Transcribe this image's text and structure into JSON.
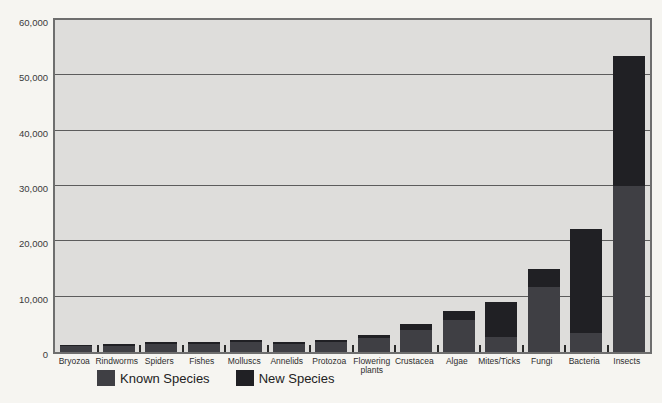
{
  "chart_data": {
    "type": "bar",
    "stacked": true,
    "title": "",
    "xlabel": "",
    "ylabel": "",
    "categories": [
      "Bryozoa",
      "Rindworms",
      "Spiders",
      "Fishes",
      "Molluscs",
      "Annelids",
      "Protozoa",
      "Flowering\nplants",
      "Crustacea",
      "Algae",
      "Mites/Ticks",
      "Fungi",
      "Bacteria",
      "Insects"
    ],
    "series": [
      {
        "name": "Known Species",
        "color": "#3f3f44",
        "values": [
          1000,
          1100,
          1500,
          1400,
          1800,
          1500,
          1800,
          2500,
          4000,
          5800,
          2800,
          11700,
          3500,
          30000
        ]
      },
      {
        "name": "New Species",
        "color": "#202024",
        "values": [
          200,
          300,
          400,
          350,
          450,
          400,
          450,
          600,
          1000,
          1700,
          6200,
          3300,
          18800,
          23500
        ]
      }
    ],
    "totals": [
      1200,
      1400,
      1900,
      1750,
      2250,
      1900,
      2250,
      3100,
      5000,
      7500,
      9000,
      15000,
      22300,
      53500
    ],
    "ylim": [
      0,
      60000
    ],
    "y_tick_step": 10000,
    "y_tick_labels": [
      "0",
      "10,000",
      "20,000",
      "30,000",
      "40,000",
      "50,000",
      "60,000"
    ],
    "grid": "horizontal",
    "legend_position": "bottom"
  },
  "colors": {
    "page_background": "#f6f5f1",
    "plot_background": "#dedddb",
    "plot_border": "#6e6e6e",
    "gridline": "#5c5c5c",
    "tick_mark": "#2a2a2a",
    "axis_text": "#3a3a3a"
  }
}
